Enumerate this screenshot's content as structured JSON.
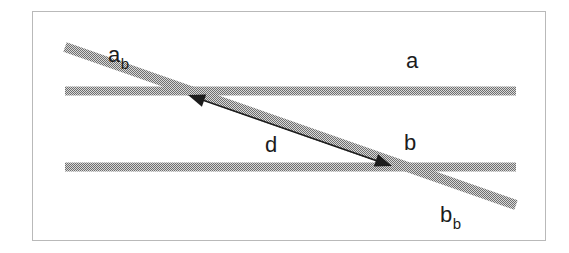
{
  "figure": {
    "type": "geometric-diagram",
    "colors": {
      "band": "#8c8c8c",
      "border": "#b9b9b9",
      "arrow": "#1c1c1c",
      "background": "#ffffff",
      "label": "#1c1c1c"
    },
    "frame": {
      "x": 32,
      "y": 11,
      "width": 513,
      "height": 229,
      "stroke_width": 1
    },
    "bands": {
      "horizontal": [
        {
          "name": "band-a",
          "x1": 65,
          "y1": 91,
          "x2": 516,
          "y2": 91,
          "thickness": 9
        },
        {
          "name": "band-b",
          "x1": 65,
          "y1": 167,
          "x2": 516,
          "y2": 167,
          "thickness": 9
        }
      ],
      "diagonal": [
        {
          "name": "band-ab",
          "x1": 65,
          "y1": 47,
          "x2": 516,
          "y2": 205,
          "thickness": 10
        }
      ]
    },
    "arrow": {
      "name": "distance-arrow",
      "x1": 188,
      "y1": 95,
      "x2": 392,
      "y2": 166,
      "stroke_width": 1.6,
      "head_length": 17,
      "head_width": 13,
      "double_headed": true
    },
    "labels": [
      {
        "id": "a_b",
        "base": "a",
        "sub": "b",
        "x": 108,
        "y": 62,
        "name": "label-a-sub-b"
      },
      {
        "id": "a",
        "base": "a",
        "sub": "",
        "x": 406,
        "y": 68,
        "name": "label-a"
      },
      {
        "id": "d",
        "base": "d",
        "sub": "",
        "x": 265,
        "y": 152,
        "name": "label-d"
      },
      {
        "id": "b",
        "base": "b",
        "sub": "",
        "x": 404,
        "y": 150,
        "name": "label-b"
      },
      {
        "id": "b_b",
        "base": "b",
        "sub": "b",
        "x": 440,
        "y": 222,
        "name": "label-b-sub-b"
      }
    ]
  }
}
